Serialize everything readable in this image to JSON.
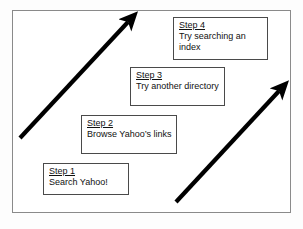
{
  "diagram": {
    "background_color": "#ffffff",
    "frame_color": "#8a8a8a",
    "arrow_color": "#000000",
    "box_border_color": "#4a4a4a",
    "text_color": "#111111"
  },
  "steps": [
    {
      "id": "step1",
      "title": "Step 1",
      "body": "Search Yahoo!"
    },
    {
      "id": "step2",
      "title": "Step 2",
      "body": "Browse Yahoo’s links"
    },
    {
      "id": "step3",
      "title": "Step 3",
      "body": "Try another directory"
    },
    {
      "id": "step4",
      "title": "Step 4",
      "body": "Try searching an index"
    }
  ],
  "arrows": [
    {
      "id": "arrow-left",
      "direction": "up-right",
      "from": [
        20,
        138
      ],
      "to": [
        132,
        18
      ]
    },
    {
      "id": "arrow-right",
      "direction": "up-right",
      "from": [
        176,
        202
      ],
      "to": [
        283,
        87
      ]
    }
  ]
}
